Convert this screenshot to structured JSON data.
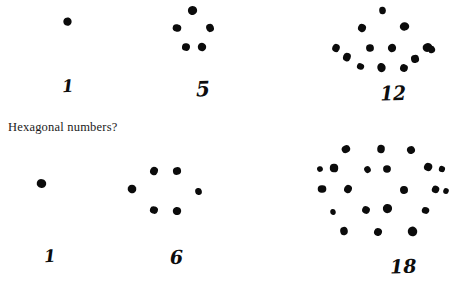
{
  "page": {
    "width": 458,
    "height": 284,
    "background_color": "#ffffff",
    "ink_color": "#0b0b0b",
    "text_color": "#1a1a1a"
  },
  "caption": {
    "text": "Hexagonal numbers?",
    "x": 8,
    "y": 120
  },
  "figures": [
    {
      "id": "fig-top-1",
      "label": "1",
      "dot_count": 1,
      "row": "top",
      "origin": {
        "x": 40,
        "y": 8
      },
      "box": {
        "w": 80,
        "h": 70
      },
      "label_position": {
        "x": 62,
        "y": 78
      },
      "label_style": "n-one",
      "dots": [
        {
          "x": 28,
          "y": 14,
          "r": 4.6
        }
      ]
    },
    {
      "id": "fig-top-5",
      "label": "5",
      "dot_count": 5,
      "row": "top",
      "origin": {
        "x": 172,
        "y": 4
      },
      "box": {
        "w": 80,
        "h": 70
      },
      "label_position": {
        "x": 196,
        "y": 79
      },
      "label_style": "n-five",
      "dots": [
        {
          "x": 20,
          "y": 6,
          "r": 4.4
        },
        {
          "x": 5,
          "y": 24,
          "r": 3.8
        },
        {
          "x": 38,
          "y": 24,
          "r": 3.8
        },
        {
          "x": 14,
          "y": 43,
          "r": 3.9
        },
        {
          "x": 30,
          "y": 43,
          "r": 4.0
        }
      ]
    },
    {
      "id": "fig-top-12",
      "label": "12",
      "dot_count": 13,
      "row": "top",
      "origin": {
        "x": 330,
        "y": 8
      },
      "box": {
        "w": 110,
        "h": 80
      },
      "label_position": {
        "x": 380,
        "y": 84
      },
      "label_style": "n-twelve",
      "dots": [
        {
          "x": 53,
          "y": 3,
          "r": 3.6
        },
        {
          "x": 32,
          "y": 20,
          "r": 4.0
        },
        {
          "x": 74,
          "y": 18,
          "r": 4.4
        },
        {
          "x": 6,
          "y": 40,
          "r": 4.0
        },
        {
          "x": 40,
          "y": 40,
          "r": 4.2
        },
        {
          "x": 62,
          "y": 40,
          "r": 4.0
        },
        {
          "x": 97,
          "y": 39,
          "r": 4.4
        },
        {
          "x": 17,
          "y": 49,
          "r": 3.8
        },
        {
          "x": 85,
          "y": 51,
          "r": 3.8
        },
        {
          "x": 31,
          "y": 59,
          "r": 3.6
        },
        {
          "x": 52,
          "y": 60,
          "r": 4.7
        },
        {
          "x": 74,
          "y": 60,
          "r": 3.8
        },
        {
          "x": 101,
          "y": 41,
          "r": 3.4
        }
      ]
    },
    {
      "id": "fig-bottom-1",
      "label": "1",
      "dot_count": 1,
      "row": "bottom",
      "origin": {
        "x": 28,
        "y": 172
      },
      "box": {
        "w": 80,
        "h": 70
      },
      "label_position": {
        "x": 44,
        "y": 248
      },
      "label_style": "n-one",
      "dots": [
        {
          "x": 13,
          "y": 11,
          "r": 4.3
        }
      ]
    },
    {
      "id": "fig-bottom-6",
      "label": "6",
      "dot_count": 6,
      "row": "bottom",
      "origin": {
        "x": 128,
        "y": 160
      },
      "box": {
        "w": 90,
        "h": 80
      },
      "label_position": {
        "x": 170,
        "y": 248
      },
      "label_style": "n-six",
      "dots": [
        {
          "x": 26,
          "y": 11,
          "r": 4.0
        },
        {
          "x": 49,
          "y": 11,
          "r": 4.0
        },
        {
          "x": 4,
          "y": 29,
          "r": 4.0
        },
        {
          "x": 70,
          "y": 31,
          "r": 3.4
        },
        {
          "x": 26,
          "y": 50,
          "r": 3.8
        },
        {
          "x": 49,
          "y": 51,
          "r": 4.0
        }
      ]
    },
    {
      "id": "fig-bottom-18",
      "label": "18",
      "dot_count": 21,
      "row": "bottom",
      "origin": {
        "x": 318,
        "y": 145
      },
      "box": {
        "w": 136,
        "h": 110
      },
      "label_position": {
        "x": 390,
        "y": 257
      },
      "label_style": "n-eighteen",
      "dots": [
        {
          "x": 28,
          "y": 4,
          "r": 4.2
        },
        {
          "x": 63,
          "y": 4,
          "r": 4.2
        },
        {
          "x": 93,
          "y": 5,
          "r": 4.0
        },
        {
          "x": 16,
          "y": 23,
          "r": 3.8
        },
        {
          "x": 50,
          "y": 25,
          "r": 3.6
        },
        {
          "x": 69,
          "y": 24,
          "r": 4.0
        },
        {
          "x": 110,
          "y": 22,
          "r": 4.2
        },
        {
          "x": 4,
          "y": 44,
          "r": 3.8
        },
        {
          "x": 30,
          "y": 44,
          "r": 4.0
        },
        {
          "x": 86,
          "y": 45,
          "r": 4.0
        },
        {
          "x": 118,
          "y": 45,
          "r": 3.6
        },
        {
          "x": 15,
          "y": 67,
          "r": 3.2
        },
        {
          "x": 48,
          "y": 65,
          "r": 4.0
        },
        {
          "x": 70,
          "y": 64,
          "r": 4.6
        },
        {
          "x": 108,
          "y": 66,
          "r": 3.6
        },
        {
          "x": 26,
          "y": 86,
          "r": 4.2
        },
        {
          "x": 60,
          "y": 87,
          "r": 4.0
        },
        {
          "x": 94,
          "y": 86,
          "r": 4.4
        },
        {
          "x": 128,
          "y": 46,
          "r": 3.0
        },
        {
          "x": 2,
          "y": 24,
          "r": 3.2
        },
        {
          "x": 124,
          "y": 24,
          "r": 2.8
        }
      ]
    }
  ]
}
